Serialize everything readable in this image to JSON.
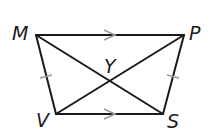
{
  "diagram": {
    "type": "isosceles-trapezoid",
    "vertices": {
      "M": {
        "label": "M",
        "x": 36,
        "y": 35
      },
      "P": {
        "label": "P",
        "x": 184,
        "y": 35
      },
      "S": {
        "label": "S",
        "x": 163,
        "y": 114
      },
      "V": {
        "label": "V",
        "x": 56,
        "y": 114
      }
    },
    "intersection": {
      "label": "Y"
    },
    "parallel_marks": [
      "MP",
      "VS"
    ],
    "congruent_marks": [
      "MV",
      "PS"
    ],
    "colors": {
      "line": "#1a1a1a",
      "mark": "#9a9a9a"
    }
  }
}
